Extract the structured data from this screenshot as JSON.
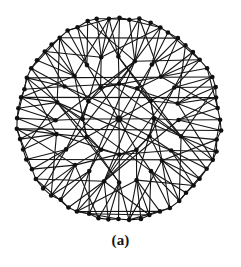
{
  "figure": {
    "caption": "(a)",
    "kind": "graph-diagram",
    "background_color": "#ffffff",
    "ink_color": "#101010",
    "node_color": "#101010",
    "edge_color": "#151515"
  },
  "chart_data": {
    "type": "graph",
    "title": "(a)",
    "layout": "radial",
    "center": [
      119,
      119
    ],
    "rings": [
      {
        "name": "hub",
        "radius": 0,
        "count": 1
      },
      {
        "name": "inner",
        "radius": 36,
        "count": 12
      },
      {
        "name": "middle",
        "radius": 62,
        "count": 24
      },
      {
        "name": "outer",
        "radius": 101,
        "count": 60
      }
    ],
    "counts": {
      "nodes": 97,
      "hub_spokes": 12,
      "inner_polygon_edges": 12,
      "outer_cycle_edges": 60
    },
    "node_radius_px": 2.3,
    "edge_width_px": 1.1,
    "angle_offset_deg": -90,
    "edge_families": [
      {
        "name": "hub-spokes",
        "from": "hub",
        "to": "inner",
        "pattern": "hub to every inner node"
      },
      {
        "name": "inner-polygon",
        "from": "inner",
        "to": "inner",
        "pattern": "consecutive inner nodes"
      },
      {
        "name": "outer-cycle",
        "from": "outer",
        "to": "outer",
        "pattern": "consecutive outer nodes"
      },
      {
        "name": "inner-to-middle",
        "from": "inner",
        "to": "middle",
        "pattern": "each inner node to 2 middle nodes of its sector"
      },
      {
        "name": "middle-to-outer",
        "from": "middle",
        "to": "outer",
        "pattern": "each middle node fans to several outer nodes"
      },
      {
        "name": "long-chords",
        "from": "middle",
        "to": "middle",
        "pattern": "middle nodes to middle nodes several sectors away"
      },
      {
        "name": "horizontal-chords",
        "from": "outer",
        "to": "outer",
        "pattern": "near-horizontal long chords across the disk"
      }
    ]
  }
}
